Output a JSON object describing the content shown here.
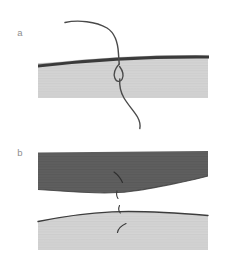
{
  "figure": {
    "width": 235,
    "height": 265,
    "background": "#ffffff",
    "type": "scientific-illustration",
    "panels": [
      {
        "id": "a",
        "label": "a",
        "label_x": 20,
        "label_y": 36,
        "description": "Light gray tissue block capped by a dark cortical band, with a curved suture thread passing through it and looping below."
      },
      {
        "id": "b",
        "label": "b",
        "label_x": 20,
        "label_y": 156,
        "description": "Dark gray block above and light gray block below, separated, with small severed suture fragments at the interface."
      }
    ]
  },
  "colors": {
    "background": "#ffffff",
    "tissue_light": "#d2d2d2",
    "tissue_light_alt": "#d3d3d3",
    "tissue_dark": "#5e5e5e",
    "cortical_band": "#3a3a3a",
    "outline": "#3d3d3d",
    "thread": "#4a4a4a",
    "label_text": "#8e8e8e",
    "striation": "#c4c4c4",
    "striation_dark": "#585858"
  },
  "panel_a": {
    "block": {
      "name": "light-tissue-block",
      "fill": "#d2d2d2",
      "x_left": 38,
      "x_right": 208,
      "y_top_left": 63,
      "y_top_right": 58,
      "y_bottom": 98
    },
    "cortical_band": {
      "name": "dark-cortical-band",
      "fill": "#3a3a3a",
      "x_left": 38,
      "x_right": 209,
      "y_left": 63,
      "y_right": 56,
      "thickness": 3.2
    },
    "thread": {
      "name": "suture-thread",
      "stroke": "#4a4a4a",
      "width": 1.4,
      "start": [
        65,
        22
      ],
      "end": [
        140,
        128
      ],
      "passes_through_x": 120,
      "loop_center": [
        118,
        72
      ],
      "loop_radius": 6
    }
  },
  "panel_b": {
    "upper_block": {
      "name": "dark-tissue-block",
      "fill": "#5e5e5e",
      "x_left": 38,
      "x_right": 208,
      "y_top": 152,
      "y_bottom_left": 189,
      "y_bottom_mid": 193,
      "y_bottom_right": 180
    },
    "lower_block": {
      "name": "light-tissue-block",
      "fill": "#d3d3d3",
      "x_left": 38,
      "x_right": 208,
      "y_top_left": 221,
      "y_top_mid": 212,
      "y_top_right": 215,
      "y_bottom": 250
    },
    "lower_block_outline": {
      "name": "tissue-surface-outline",
      "stroke": "#3d3d3d",
      "width": 1.3
    },
    "fragments": [
      {
        "name": "thread-fragment-upper",
        "x": 120,
        "y": 176
      },
      {
        "name": "thread-fragment-middle",
        "x": 117,
        "y": 194
      },
      {
        "name": "thread-fragment-interface",
        "x": 119,
        "y": 209
      },
      {
        "name": "thread-fragment-lower",
        "x": 121,
        "y": 230
      }
    ]
  }
}
